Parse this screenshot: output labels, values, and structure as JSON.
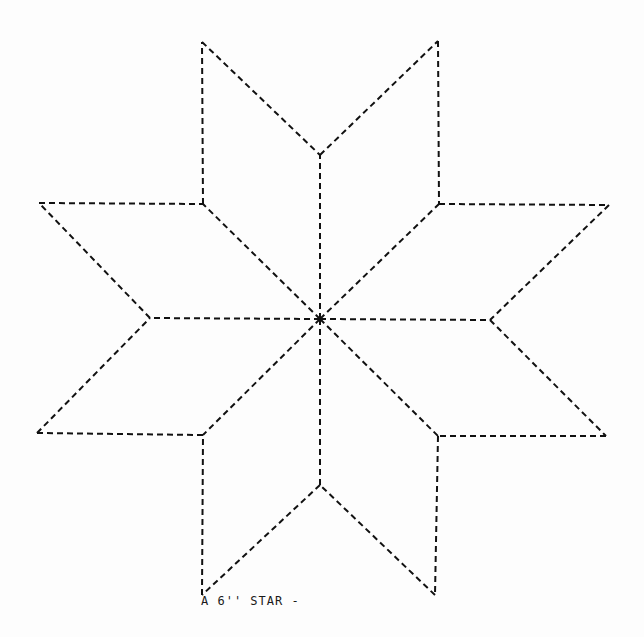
{
  "diagram": {
    "type": "quilt-pattern",
    "caption": "A 6'' STAR -",
    "line_style": "dashed",
    "line_color": "#111111",
    "center": [
      320,
      319
    ],
    "vertices": {
      "top_left_tip": [
        202,
        42
      ],
      "top_right_tip": [
        438,
        41
      ],
      "top_notch": [
        320,
        155
      ],
      "left_top_tip": [
        39,
        203
      ],
      "left_top_inner": [
        203,
        204
      ],
      "right_top_inner": [
        439,
        204
      ],
      "right_top_tip": [
        609,
        205
      ],
      "left_notch": [
        150,
        318
      ],
      "right_notch": [
        490,
        320
      ],
      "left_bottom_tip": [
        37,
        433
      ],
      "left_bottom_inner": [
        203,
        435
      ],
      "right_bottom_inner": [
        438,
        436
      ],
      "right_bottom_tip": [
        606,
        436
      ],
      "bottom_notch": [
        320,
        485
      ],
      "bottom_left_tip": [
        202,
        595
      ],
      "bottom_right_tip": [
        435,
        595
      ]
    },
    "diamonds": 8
  }
}
